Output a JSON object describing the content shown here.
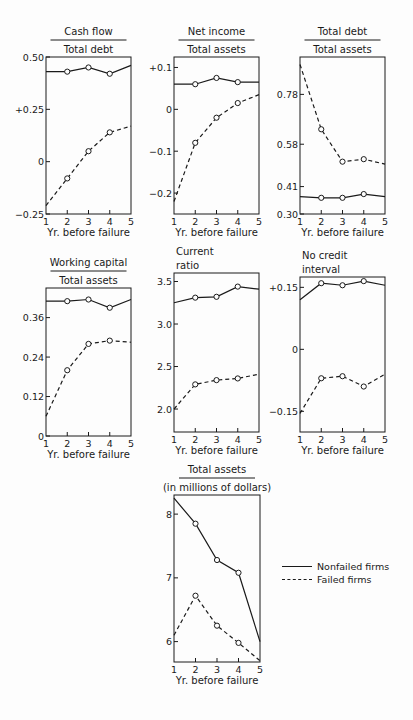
{
  "legend": {
    "nonfailed": "Nonfailed firms",
    "failed": "Failed firms"
  },
  "chart_data": [
    {
      "type": "line",
      "title": [
        "Cash flow",
        "Total debt"
      ],
      "xlabel": "Yr. before failure",
      "x": [
        1,
        2,
        3,
        4,
        5
      ],
      "yticks": [
        {
          "v": 0.5,
          "l": "0.50"
        },
        {
          "v": 0.25,
          "l": "+0.25"
        },
        {
          "v": 0,
          "l": "0"
        },
        {
          "v": -0.25,
          "l": "-0.25"
        }
      ],
      "ylim": [
        -0.25,
        0.5
      ],
      "series": [
        {
          "name": "Nonfailed firms",
          "values": [
            0.43,
            0.43,
            0.45,
            0.42,
            0.46
          ]
        },
        {
          "name": "Failed firms",
          "values": [
            -0.21,
            -0.08,
            0.05,
            0.14,
            0.17
          ]
        }
      ],
      "frame": [
        46,
        57,
        131,
        214
      ],
      "fraction": true
    },
    {
      "type": "line",
      "title": [
        "Net income",
        "Total assets"
      ],
      "xlabel": "Yr. before failure",
      "x": [
        1,
        2,
        3,
        4,
        5
      ],
      "yticks": [
        {
          "v": 0.1,
          "l": "+0.1"
        },
        {
          "v": 0,
          "l": "0"
        },
        {
          "v": -0.1,
          "l": "-0.1"
        },
        {
          "v": -0.2,
          "l": "-0.2"
        }
      ],
      "ylim": [
        -0.25,
        0.125
      ],
      "series": [
        {
          "name": "Nonfailed firms",
          "values": [
            0.06,
            0.06,
            0.075,
            0.065,
            0.065
          ]
        },
        {
          "name": "Failed firms",
          "values": [
            -0.22,
            -0.08,
            -0.02,
            0.015,
            0.035
          ]
        }
      ],
      "frame": [
        174,
        57,
        259,
        214
      ],
      "fraction": true
    },
    {
      "type": "line",
      "title": [
        "Total debt",
        "Total assets"
      ],
      "xlabel": "Yr. before failure",
      "x": [
        1,
        2,
        3,
        4,
        5
      ],
      "yticks": [
        {
          "v": 0.78,
          "l": "0.78"
        },
        {
          "v": 0.58,
          "l": "0.58"
        },
        {
          "v": 0.41,
          "l": "0.41"
        },
        {
          "v": 0.3,
          "l": "0.30"
        }
      ],
      "ylim": [
        0.3,
        0.93
      ],
      "series": [
        {
          "name": "Nonfailed firms",
          "values": [
            0.37,
            0.365,
            0.365,
            0.38,
            0.37
          ]
        },
        {
          "name": "Failed firms",
          "values": [
            0.9,
            0.64,
            0.51,
            0.52,
            0.5
          ]
        }
      ],
      "frame": [
        300,
        57,
        385,
        214
      ],
      "fraction": true
    },
    {
      "type": "line",
      "title": [
        "Working capital",
        "Total assets"
      ],
      "xlabel": "Yr. before failure",
      "x": [
        1,
        2,
        3,
        4,
        5
      ],
      "yticks": [
        {
          "v": 0.36,
          "l": "0.36"
        },
        {
          "v": 0.24,
          "l": "0.24"
        },
        {
          "v": 0.12,
          "l": "0.12"
        },
        {
          "v": 0,
          "l": "0"
        }
      ],
      "ylim": [
        0,
        0.45
      ],
      "series": [
        {
          "name": "Nonfailed firms",
          "values": [
            0.41,
            0.41,
            0.415,
            0.39,
            0.415
          ]
        },
        {
          "name": "Failed firms",
          "values": [
            0.06,
            0.2,
            0.28,
            0.29,
            0.285
          ]
        }
      ],
      "frame": [
        46,
        288,
        131,
        436
      ],
      "fraction": true
    },
    {
      "type": "line",
      "title": [
        "Current",
        "ratio"
      ],
      "xlabel": "Yr. before failure",
      "x": [
        1,
        2,
        3,
        4,
        5
      ],
      "yticks": [
        {
          "v": 3.5,
          "l": "3.5"
        },
        {
          "v": 3.0,
          "l": "3.0"
        },
        {
          "v": 2.5,
          "l": "2.5"
        },
        {
          "v": 2.0,
          "l": "2.0"
        }
      ],
      "ylim": [
        1.73,
        3.6
      ],
      "series": [
        {
          "name": "Nonfailed firms",
          "values": [
            3.25,
            3.31,
            3.32,
            3.44,
            3.41
          ]
        },
        {
          "name": "Failed firms",
          "values": [
            2.0,
            2.29,
            2.34,
            2.36,
            2.41
          ]
        }
      ],
      "frame": [
        174,
        273,
        259,
        432
      ],
      "fraction": false
    },
    {
      "type": "line",
      "title": [
        "No credit",
        "interval"
      ],
      "xlabel": "Yr. before failure",
      "x": [
        1,
        2,
        3,
        4,
        5
      ],
      "yticks": [
        {
          "v": 0.15,
          "l": "+0.15"
        },
        {
          "v": 0,
          "l": "0"
        },
        {
          "v": -0.15,
          "l": "-0.15"
        }
      ],
      "ylim": [
        -0.2,
        0.175
      ],
      "series": [
        {
          "name": "Nonfailed firms",
          "values": [
            0.12,
            0.16,
            0.155,
            0.165,
            0.155
          ]
        },
        {
          "name": "Failed firms",
          "values": [
            -0.155,
            -0.07,
            -0.065,
            -0.09,
            -0.06
          ]
        }
      ],
      "frame": [
        300,
        277,
        385,
        432
      ],
      "fraction": false
    },
    {
      "type": "line",
      "title": [
        "Total assets",
        "(in millions of dollars)"
      ],
      "xlabel": "Yr. before failure",
      "x": [
        1,
        2,
        3,
        4,
        5
      ],
      "yticks": [
        {
          "v": 8,
          "l": "8"
        },
        {
          "v": 7,
          "l": "7"
        },
        {
          "v": 6,
          "l": "6"
        }
      ],
      "ylim": [
        5.68,
        8.3
      ],
      "series": [
        {
          "name": "Nonfailed firms",
          "values": [
            8.25,
            7.85,
            7.28,
            7.08,
            6.0
          ]
        },
        {
          "name": "Failed firms",
          "values": [
            6.1,
            6.72,
            6.25,
            5.98,
            5.7
          ]
        }
      ],
      "frame": [
        174,
        495,
        260,
        662
      ],
      "fraction": true
    }
  ]
}
